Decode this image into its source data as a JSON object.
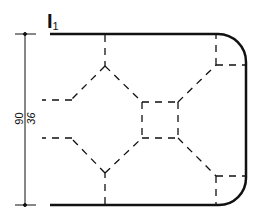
{
  "diagram": {
    "title_main": "I",
    "title_sub": "1",
    "dimensions": {
      "outer": "90",
      "inner": "36"
    },
    "colors": {
      "stroke": "#111111",
      "background": "#ffffff"
    }
  }
}
